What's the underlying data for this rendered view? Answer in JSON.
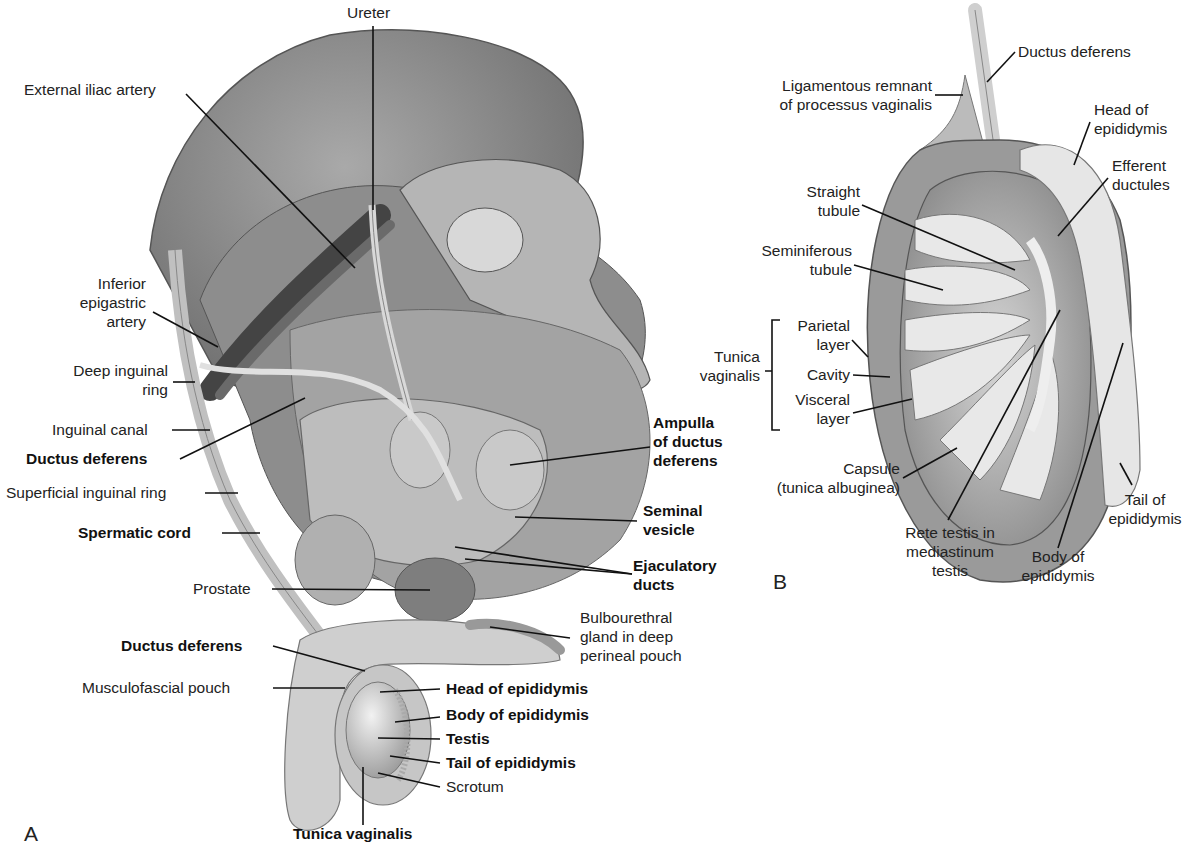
{
  "figure": {
    "panels": [
      {
        "id": "A",
        "label": "A"
      },
      {
        "id": "B",
        "label": "B"
      }
    ],
    "panel_a": {
      "labels": [
        {
          "text": "Ureter",
          "bold": false
        },
        {
          "text": "External iliac artery",
          "bold": false
        },
        {
          "text": "Inferior epigastric artery",
          "lines": [
            "Inferior",
            "epigastric",
            "artery"
          ],
          "bold": false
        },
        {
          "text": "Deep inguinal ring",
          "lines": [
            "Deep inguinal",
            "ring"
          ],
          "bold": false
        },
        {
          "text": "Inguinal canal",
          "bold": false
        },
        {
          "text": "Ductus deferens",
          "bold": true
        },
        {
          "text": "Superficial inguinal ring",
          "bold": false
        },
        {
          "text": "Spermatic cord",
          "bold": true
        },
        {
          "text": "Prostate",
          "bold": false
        },
        {
          "text": "Ductus deferens",
          "bold": true
        },
        {
          "text": "Musculofascial pouch",
          "bold": false
        },
        {
          "text": "Ampulla of ductus deferens",
          "lines": [
            "Ampulla",
            "of ductus",
            "deferens"
          ],
          "bold": true
        },
        {
          "text": "Seminal vesicle",
          "lines": [
            "Seminal",
            "vesicle"
          ],
          "bold": true
        },
        {
          "text": "Ejaculatory ducts",
          "lines": [
            "Ejaculatory",
            "ducts"
          ],
          "bold": true
        },
        {
          "text": "Bulbourethral gland in deep perineal pouch",
          "lines": [
            "Bulbourethral",
            "gland in deep",
            "perineal pouch"
          ],
          "bold": false
        },
        {
          "text": "Head of epididymis",
          "bold": true
        },
        {
          "text": "Body of epididymis",
          "bold": true
        },
        {
          "text": "Testis",
          "bold": true
        },
        {
          "text": "Tail of epididymis",
          "bold": true
        },
        {
          "text": "Scrotum",
          "bold": false
        },
        {
          "text": "Tunica vaginalis",
          "bold": true
        }
      ]
    },
    "panel_b": {
      "labels": [
        {
          "text": "Ductus deferens"
        },
        {
          "text": "Ligamentous remnant of processus vaginalis",
          "lines": [
            "Ligamentous remnant",
            "of processus vaginalis"
          ]
        },
        {
          "text": "Head of epididymis",
          "lines": [
            "Head of",
            "epididymis"
          ]
        },
        {
          "text": "Efferent ductules",
          "lines": [
            "Efferent",
            "ductules"
          ]
        },
        {
          "text": "Straight tubule",
          "lines": [
            "Straight",
            "tubule"
          ]
        },
        {
          "text": "Seminiferous tubule",
          "lines": [
            "Seminiferous",
            "tubule"
          ]
        },
        {
          "text": "Tunica vaginalis",
          "lines": [
            "Tunica",
            "vaginalis"
          ]
        },
        {
          "text": "Parietal layer",
          "lines": [
            "Parietal",
            "layer"
          ]
        },
        {
          "text": "Cavity"
        },
        {
          "text": "Visceral layer",
          "lines": [
            "Visceral",
            "layer"
          ]
        },
        {
          "text": "Capsule (tunica albuginea)",
          "lines": [
            "Capsule",
            "(tunica albuginea)"
          ]
        },
        {
          "text": "Rete testis in mediastinum testis",
          "lines": [
            "Rete testis in",
            "mediastinum",
            "testis"
          ]
        },
        {
          "text": "Body of epididymis",
          "lines": [
            "Body of",
            "epididymis"
          ]
        },
        {
          "text": "Tail of epididymis",
          "lines": [
            "Tail of",
            "epididymis"
          ]
        }
      ]
    },
    "colors": {
      "background": "#ffffff",
      "tissue_dark": "#6e6e6e",
      "tissue_mid": "#9c9c9c",
      "tissue_light": "#c8c8c8",
      "leader_line": "#111111"
    }
  }
}
